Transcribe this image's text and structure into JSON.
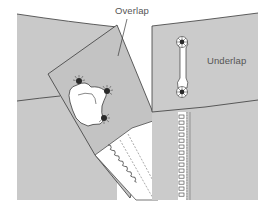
{
  "diagram": {
    "type": "sewing-illustration",
    "labels": {
      "overlap": "Overlap",
      "underlap": "Underlap"
    },
    "colors": {
      "fabric": "#c6c6c6",
      "fabric_light": "#cfcfcf",
      "outline": "#3a3a3a",
      "facing": "#ffffff",
      "text": "#555555",
      "background": "#ffffff"
    },
    "parts": [
      "left-garment-panel",
      "overlap-flap",
      "button-tab-shaped",
      "zipper-tape-left-diagonal",
      "right-garment-panel-underlap",
      "button-loop-strap",
      "zipper-teeth-right-vertical"
    ]
  }
}
